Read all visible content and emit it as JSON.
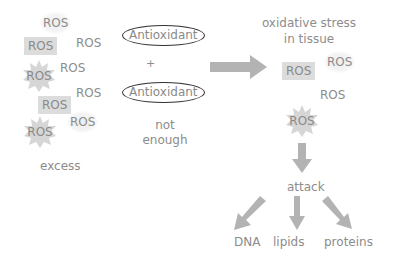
{
  "diagram": {
    "left_group": {
      "ros_labels": [
        "ROS",
        "ROS",
        "ROS",
        "ROS",
        "ROS",
        "ROS",
        "ROS",
        "ROS",
        "ROS",
        "ROS"
      ],
      "caption": "excess"
    },
    "middle_group": {
      "antioxidant_1": "Antioxidant",
      "plus": "+",
      "antioxidant_2": "Antioxidant",
      "caption_line1": "not",
      "caption_line2": "enough"
    },
    "right_group": {
      "title_line1": "oxidative stress",
      "title_line2": "in tissue",
      "ros_labels": [
        "ROS",
        "ROS",
        "ROS",
        "ROS"
      ],
      "attack": "attack",
      "targets": [
        "DNA",
        "lipids",
        "proteins"
      ]
    },
    "colors": {
      "arrow": "#b3b3b3",
      "ros_box": "#dcdcdc",
      "text": "#8c8c8c",
      "ellipse_border": "#333333"
    },
    "icons": {
      "main_arrow": "right-arrow",
      "down_arrow": "down-arrow",
      "branch_arrows": [
        "down-left-arrow",
        "down-arrow",
        "down-right-arrow"
      ]
    }
  }
}
